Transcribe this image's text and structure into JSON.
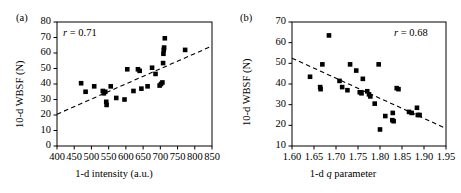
{
  "figure": {
    "background": "#ffffff",
    "marker_color": "#000000",
    "axis_color": "#000000",
    "trendline_style": "dashed"
  },
  "panels": [
    {
      "label": "(a)",
      "ylabel": "10-d WBSF (N)",
      "xlabel_prefix": "1-d intensity (a.u.)",
      "xlabel_italic": "",
      "xlabel_suffix": "",
      "annotation_prefix": "r",
      "annotation_value": " = 0.71",
      "frame": {
        "left": 57,
        "top": 22,
        "right": 212,
        "bottom": 146
      },
      "chart_data": {
        "type": "scatter",
        "title": "(a)",
        "xlabel": "1-d intensity (a.u.)",
        "ylabel": "10-d WBSF (N)",
        "xlim": [
          400,
          850
        ],
        "ylim": [
          0,
          80
        ],
        "xticks": [
          400,
          450,
          500,
          550,
          600,
          650,
          700,
          750,
          800,
          850
        ],
        "yticks": [
          0,
          10,
          20,
          30,
          40,
          50,
          60,
          70,
          80
        ],
        "grid": false,
        "annotation": "r = 0.71",
        "correlation_r": 0.71,
        "trendline": {
          "type": "linear",
          "x": [
            400,
            850
          ],
          "y": [
            20.5,
            64.5
          ],
          "style": "dashed"
        },
        "points": [
          {
            "x": 470,
            "y": 40.5
          },
          {
            "x": 483,
            "y": 35.0
          },
          {
            "x": 508,
            "y": 38.5
          },
          {
            "x": 533,
            "y": 35.5
          },
          {
            "x": 536,
            "y": 34.0
          },
          {
            "x": 540,
            "y": 35.0
          },
          {
            "x": 543,
            "y": 28.5
          },
          {
            "x": 544,
            "y": 26.5
          },
          {
            "x": 556,
            "y": 38.5
          },
          {
            "x": 572,
            "y": 31.0
          },
          {
            "x": 596,
            "y": 30.0
          },
          {
            "x": 604,
            "y": 49.5
          },
          {
            "x": 622,
            "y": 35.5
          },
          {
            "x": 635,
            "y": 49.5
          },
          {
            "x": 640,
            "y": 48.5
          },
          {
            "x": 645,
            "y": 37.0
          },
          {
            "x": 663,
            "y": 38.5
          },
          {
            "x": 676,
            "y": 50.5
          },
          {
            "x": 686,
            "y": 46.5
          },
          {
            "x": 698,
            "y": 39.0
          },
          {
            "x": 702,
            "y": 40.0
          },
          {
            "x": 706,
            "y": 41.0
          },
          {
            "x": 708,
            "y": 53.5
          },
          {
            "x": 709,
            "y": 59.5
          },
          {
            "x": 710,
            "y": 62.0
          },
          {
            "x": 711,
            "y": 63.5
          },
          {
            "x": 713,
            "y": 69.5
          },
          {
            "x": 772,
            "y": 62.0
          }
        ]
      }
    },
    {
      "label": "(b)",
      "ylabel": "10-d WBSF (N)",
      "xlabel_prefix": "1-d ",
      "xlabel_italic": "q",
      "xlabel_suffix": " parameter",
      "annotation_prefix": "r",
      "annotation_value": " = 0.68",
      "frame": {
        "left": 61,
        "top": 22,
        "right": 215,
        "bottom": 146
      },
      "chart_data": {
        "type": "scatter",
        "title": "(b)",
        "xlabel": "1-d q parameter",
        "ylabel": "10-d WBSF (N)",
        "xlim": [
          1.6,
          1.95
        ],
        "ylim": [
          10,
          70
        ],
        "xticks": [
          1.6,
          1.65,
          1.7,
          1.75,
          1.8,
          1.85,
          1.9,
          1.95
        ],
        "yticks": [
          10,
          20,
          30,
          40,
          50,
          60,
          70
        ],
        "grid": false,
        "annotation": "r = 0.68",
        "correlation_r": 0.68,
        "trendline": {
          "type": "linear",
          "x": [
            1.6,
            1.95
          ],
          "y": [
            52.5,
            18.5
          ],
          "style": "dashed"
        },
        "points": [
          {
            "x": 1.641,
            "y": 43.5
          },
          {
            "x": 1.664,
            "y": 38.5
          },
          {
            "x": 1.665,
            "y": 37.5
          },
          {
            "x": 1.669,
            "y": 49.5
          },
          {
            "x": 1.684,
            "y": 63.5
          },
          {
            "x": 1.708,
            "y": 41.5
          },
          {
            "x": 1.714,
            "y": 38.5
          },
          {
            "x": 1.726,
            "y": 37.0
          },
          {
            "x": 1.732,
            "y": 49.5
          },
          {
            "x": 1.746,
            "y": 46.5
          },
          {
            "x": 1.754,
            "y": 36.0
          },
          {
            "x": 1.758,
            "y": 35.5
          },
          {
            "x": 1.761,
            "y": 42.5
          },
          {
            "x": 1.771,
            "y": 36.5
          },
          {
            "x": 1.775,
            "y": 35.0
          },
          {
            "x": 1.778,
            "y": 34.0
          },
          {
            "x": 1.788,
            "y": 30.5
          },
          {
            "x": 1.797,
            "y": 49.5
          },
          {
            "x": 1.8,
            "y": 18.0
          },
          {
            "x": 1.812,
            "y": 24.5
          },
          {
            "x": 1.828,
            "y": 22.5
          },
          {
            "x": 1.829,
            "y": 26.0
          },
          {
            "x": 1.831,
            "y": 22.0
          },
          {
            "x": 1.838,
            "y": 38.0
          },
          {
            "x": 1.842,
            "y": 37.5
          },
          {
            "x": 1.866,
            "y": 26.5
          },
          {
            "x": 1.872,
            "y": 26.0
          },
          {
            "x": 1.884,
            "y": 28.5
          },
          {
            "x": 1.886,
            "y": 25.0
          },
          {
            "x": 1.89,
            "y": 25.0
          }
        ]
      }
    }
  ]
}
